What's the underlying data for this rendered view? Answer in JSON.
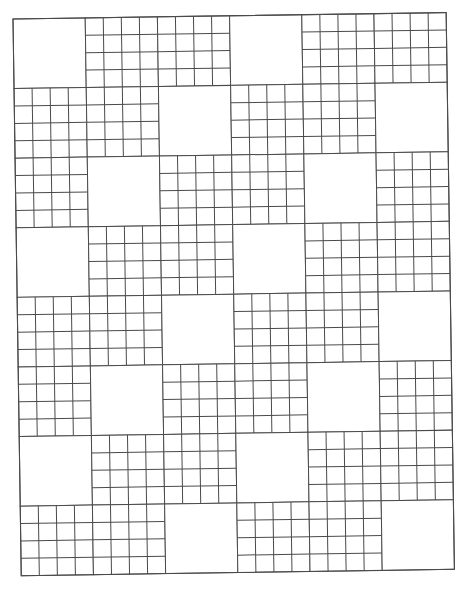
{
  "page": {
    "background": "#ffffff",
    "line_color": "#4a4a4a"
  },
  "grid": {
    "origin": [
      13,
      19
    ],
    "block_width": 72.2,
    "block_height": 69.6,
    "rotation_deg": -0.85,
    "block_columns": 6,
    "block_rows": 8,
    "subdivisions": 4,
    "blank_blocks": [
      [
        0,
        3
      ],
      [
        2,
        5
      ],
      [
        1,
        4
      ],
      [
        0,
        3
      ],
      [
        2,
        5
      ],
      [
        1,
        4
      ],
      [
        0,
        3
      ],
      [
        2,
        5
      ]
    ]
  }
}
